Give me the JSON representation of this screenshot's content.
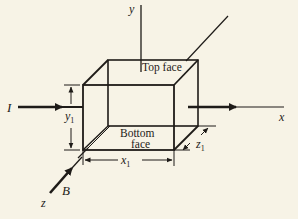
{
  "diagram": {
    "type": "3D rectangular block in coordinate axes (Hall effect setup)",
    "axes": {
      "x_label": "x",
      "y_label": "y",
      "z_label": "z"
    },
    "vectors": {
      "current_label": "I",
      "field_label": "B"
    },
    "faces": {
      "top": "Top face",
      "bottom_line1": "Bottom",
      "bottom_line2": "face"
    },
    "dimensions": {
      "x1": {
        "base": "x",
        "sub": "1"
      },
      "y1": {
        "base": "y",
        "sub": "1"
      },
      "z1": {
        "base": "z",
        "sub": "1"
      }
    },
    "colors": {
      "ink": "#1e1b18",
      "paper": "#f7f3e6"
    }
  }
}
